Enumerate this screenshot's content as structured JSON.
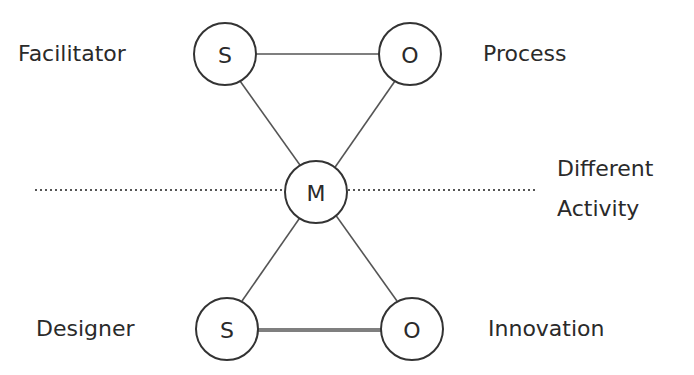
{
  "diagram": {
    "nodes": [
      {
        "id": "s_top",
        "letter": "S",
        "role_label": "Facilitator"
      },
      {
        "id": "o_top",
        "letter": "O",
        "role_label": "Process"
      },
      {
        "id": "m_mid",
        "letter": "M",
        "role_label": ""
      },
      {
        "id": "s_bottom",
        "letter": "S",
        "role_label": "Designer"
      },
      {
        "id": "o_bottom",
        "letter": "O",
        "role_label": "Innovation"
      }
    ],
    "edges": [
      {
        "from": "s_top",
        "to": "o_top"
      },
      {
        "from": "s_top",
        "to": "o_bottom"
      },
      {
        "from": "o_top",
        "to": "s_bottom"
      },
      {
        "from": "s_bottom",
        "to": "o_bottom"
      }
    ],
    "divider_label_line1": "Different",
    "divider_label_line2": "Activity",
    "colors": {
      "ink": "#2a2a2a",
      "line": "#555555",
      "background": "#ffffff"
    }
  }
}
